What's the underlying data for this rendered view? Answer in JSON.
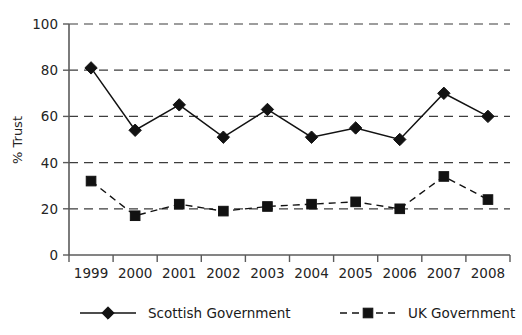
{
  "chart_data": {
    "type": "line",
    "title": "",
    "xlabel": "",
    "ylabel": "% Trust",
    "ylim": [
      0,
      100
    ],
    "yticks": [
      0,
      20,
      40,
      60,
      80,
      100
    ],
    "grid": true,
    "legend_position": "bottom",
    "categories": [
      "1999",
      "2000",
      "2001",
      "2002",
      "2003",
      "2004",
      "2005",
      "2006",
      "2007",
      "2008"
    ],
    "series": [
      {
        "name": "Scottish Government",
        "marker": "diamond",
        "linestyle": "solid",
        "color": "#121212",
        "values": [
          81,
          54,
          65,
          51,
          63,
          51,
          55,
          50,
          70,
          60
        ]
      },
      {
        "name": "UK Government",
        "marker": "square",
        "linestyle": "dashed",
        "color": "#121212",
        "values": [
          32,
          17,
          22,
          19,
          21,
          22,
          23,
          20,
          34,
          24
        ]
      }
    ]
  },
  "axis": {
    "y_title": "% Trust",
    "y_tick_labels": [
      "0",
      "20",
      "40",
      "60",
      "80",
      "100"
    ],
    "x_tick_labels": [
      "1999",
      "2000",
      "2001",
      "2002",
      "2003",
      "2004",
      "2005",
      "2006",
      "2007",
      "2008"
    ]
  },
  "legend": {
    "items": [
      {
        "label": "Scottish Government",
        "marker": "diamond-marker-icon",
        "line": "solid"
      },
      {
        "label": "UK Government",
        "marker": "square-marker-icon",
        "line": "dashed"
      }
    ]
  }
}
